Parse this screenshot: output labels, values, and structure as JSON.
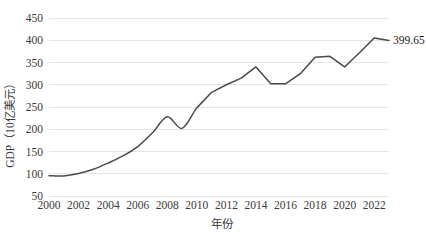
{
  "chart_data": {
    "type": "line",
    "title": "",
    "subtitle": "",
    "xlabel": "年份",
    "ylabel": "GDP（10亿美元）",
    "xlim": [
      2000,
      2023
    ],
    "ylim": [
      50,
      450
    ],
    "grid": true,
    "legend": false,
    "legend_position": "none",
    "x_tick_labels": [
      "2000",
      "2002",
      "2004",
      "2006",
      "2008",
      "2010",
      "2012",
      "2014",
      "2016",
      "2018",
      "2020",
      "2022"
    ],
    "x_tick_values": [
      2000,
      2002,
      2004,
      2006,
      2008,
      2010,
      2012,
      2014,
      2016,
      2018,
      2020,
      2022
    ],
    "y_tick_labels": [
      "50",
      "100",
      "150",
      "200",
      "250",
      "300",
      "350",
      "400",
      "450"
    ],
    "y_tick_values": [
      50,
      100,
      150,
      200,
      250,
      300,
      350,
      400,
      450
    ],
    "x": [
      2000,
      2001,
      2002,
      2003,
      2004,
      2005,
      2006,
      2007,
      2008,
      2009,
      2010,
      2011,
      2012,
      2013,
      2014,
      2015,
      2016,
      2017,
      2018,
      2019,
      2020,
      2021,
      2022,
      2023
    ],
    "series": [
      {
        "name": "GDP",
        "color": "#4a4a4a",
        "values": [
          95.5,
          95.0,
          100.5,
          110.0,
          124.0,
          140.0,
          161.0,
          192.0,
          228.0,
          202.0,
          248.0,
          283.0,
          300.0,
          315.0,
          340.0,
          302.0,
          302.0,
          325.0,
          362.0,
          364.0,
          340.0,
          372.0,
          405.0,
          399.65
        ]
      }
    ],
    "annotations": [
      {
        "name": "end-point-value",
        "text": "399.65",
        "x": 2023,
        "y": 399.65
      }
    ]
  },
  "axis": {
    "y_title": "GDP（10亿美元）",
    "x_title": "年份"
  }
}
